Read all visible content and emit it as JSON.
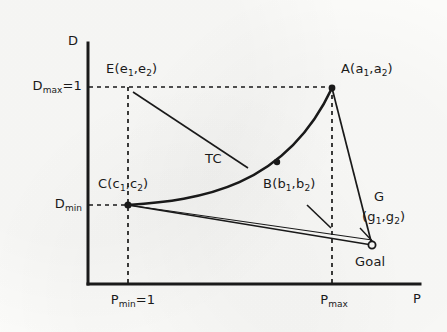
{
  "figure": {
    "type": "diagram"
  },
  "axes": {
    "y_name": "D",
    "x_name": "P",
    "y_ticks": [
      {
        "id": "dmax",
        "label_main": "D",
        "label_sub": "max",
        "label_tail": "=1",
        "value_text": "D max =1"
      },
      {
        "id": "dmin",
        "label_main": "D",
        "label_sub": "min",
        "label_tail": "",
        "value_text": "D min"
      }
    ],
    "x_ticks": [
      {
        "id": "pmin",
        "label_main": "P",
        "label_sub": "min",
        "label_tail": "=1",
        "value_text": "P min =1"
      },
      {
        "id": "pmax",
        "label_main": "P",
        "label_sub": "max",
        "label_tail": "",
        "value_text": "P max"
      }
    ]
  },
  "points": {
    "a": {
      "name": "A",
      "coords": "(a1,a2)",
      "var1": "a",
      "var2": "a",
      "marker": "filled"
    },
    "b": {
      "name": "B",
      "coords": "(b1,b2)",
      "var1": "b",
      "var2": "b",
      "marker": "filled"
    },
    "c": {
      "name": "C",
      "coords": "(c1,c2)",
      "var1": "c",
      "var2": "c",
      "marker": "filled"
    },
    "e": {
      "name": "E",
      "coords": "(e1,e2)",
      "var1": "e",
      "var2": "e",
      "marker": "none"
    },
    "g": {
      "name": "G",
      "coords": "(g1,g2)",
      "var1": "g",
      "var2": "g",
      "marker": "hollow",
      "caption": "Goal"
    }
  },
  "curve": {
    "label": "TC"
  },
  "colors": {
    "ink": "#1a1a1a",
    "paper": "#fbfbf9"
  }
}
